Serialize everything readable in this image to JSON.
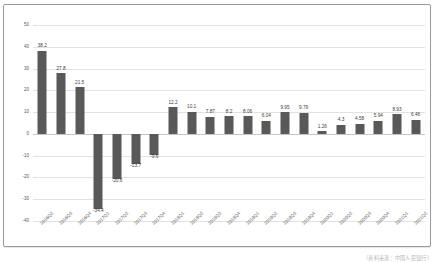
{
  "chart_data": {
    "type": "bar",
    "title": "",
    "subtitle": "",
    "xlabel": "",
    "ylabel": "",
    "ylim": [
      -40,
      50
    ],
    "yticks": [
      50,
      40,
      30,
      20,
      10,
      0,
      -10,
      -20,
      -30,
      -40
    ],
    "grid": true,
    "legend": false,
    "bar_color": "#595959",
    "categories": [
      "2016Q2",
      "2016Q3",
      "2016Q4",
      "2017Q1",
      "2017Q2",
      "2017Q3",
      "2017Q4",
      "2018Q1",
      "2018Q2",
      "2018Q3",
      "2018Q4",
      "2019Q1",
      "2019Q2",
      "2019Q3",
      "2019Q4",
      "2020Q1",
      "2020Q2",
      "2020Q3",
      "2020Q4",
      "2021Q1",
      "2021Q2"
    ],
    "values": [
      38.2,
      27.8,
      21.5,
      -34.4,
      -20.6,
      -13.7,
      -9.6,
      12.2,
      10.1,
      7.87,
      8.2,
      8.06,
      6.04,
      9.95,
      9.79,
      1.26,
      4.3,
      4.58,
      5.94,
      8.93,
      6.46
    ],
    "value_labels": [
      "38.2",
      "27.8",
      "21.5",
      "-34.4",
      "-20.6",
      "-13.7",
      "-9.6",
      "12.2",
      "10.1",
      "7.87",
      "8.2",
      "8.06",
      "6.04",
      "9.95",
      "9.79",
      "1.26",
      "4.3",
      "4.58",
      "5.94",
      "8.93",
      "6.46"
    ]
  },
  "caption": {
    "text": "（资料来源：中国人民银行）"
  }
}
